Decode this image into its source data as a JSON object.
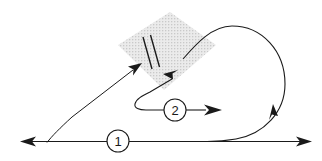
{
  "figure": {
    "title": "",
    "background_color": "#ffffff",
    "stroke_color": "#1a1a1a",
    "hatch_fill_color": "#e8e8e8",
    "hatch_line_color": "#b8b8b8",
    "width": 322,
    "height": 161
  },
  "callouts": [
    {
      "id": "callout-1",
      "label": "1",
      "cx": 118,
      "cy": 141,
      "r": 11
    },
    {
      "id": "callout-2",
      "label": "2",
      "cx": 175,
      "cy": 110,
      "r": 11
    }
  ],
  "paths": {
    "baseline": {
      "name": "horizontal-baseline",
      "left_arrow_tip_x": 20,
      "right_arrow_tip_x": 312,
      "y": 141
    },
    "diagonal_incoming": {
      "name": "diagonal-incoming-ray",
      "from": "47,142",
      "to": "142,63"
    },
    "loop": {
      "name": "right-return-loop",
      "description": "large clockwise loop on the right side"
    },
    "branch_2": {
      "name": "branch-two-path",
      "description": "u-turn path from hatched block to callout 2 arrow"
    }
  },
  "hatched_block": {
    "name": "hatched-block",
    "corners": "118,45 170,12 216,45 164,90",
    "rotation_deg": -32
  },
  "gap_symbol": {
    "name": "gap-break-symbol",
    "line_a": "143,38 152,69",
    "line_b": "150,36 159,67"
  },
  "arrowheads": [
    {
      "name": "arrowhead-baseline-left",
      "direction": "left"
    },
    {
      "name": "arrowhead-baseline-right",
      "direction": "right"
    },
    {
      "name": "arrowhead-into-block",
      "direction": "up-right"
    },
    {
      "name": "arrowhead-out-of-block",
      "direction": "down-left"
    },
    {
      "name": "arrowhead-loop-up",
      "direction": "up"
    },
    {
      "name": "arrowhead-callout-2",
      "direction": "right"
    }
  ]
}
